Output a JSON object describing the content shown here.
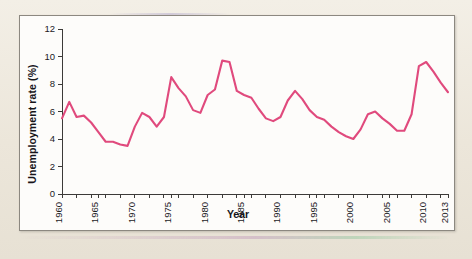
{
  "figure": {
    "panel_background": "#fdfcfa",
    "page_background": "#efeae0",
    "border_color": "#8c8880"
  },
  "axes": {
    "y_title": "Unemployment rate (%)",
    "x_title": "Year",
    "y_ticks": [
      "0",
      "2",
      "4",
      "6",
      "8",
      "10",
      "12"
    ],
    "x_ticks": [
      "1960",
      "1965",
      "1970",
      "1975",
      "1980",
      "1985",
      "1990",
      "1995",
      "2000",
      "2005",
      "2010",
      "2013"
    ]
  },
  "chart_data": {
    "type": "line",
    "title": "",
    "xlabel": "Year",
    "ylabel": "Unemployment rate (%)",
    "xlim": [
      1960,
      2013
    ],
    "ylim": [
      0,
      12
    ],
    "ytick_values": [
      0,
      2,
      4,
      6,
      8,
      10,
      12
    ],
    "xtick_values": [
      1960,
      1965,
      1970,
      1975,
      1980,
      1985,
      1990,
      1995,
      2000,
      2005,
      2010,
      2013
    ],
    "grid": false,
    "legend": "none",
    "line_color": "#e04a7d",
    "x": [
      1960,
      1961,
      1962,
      1963,
      1964,
      1965,
      1966,
      1967,
      1968,
      1969,
      1970,
      1971,
      1972,
      1973,
      1974,
      1975,
      1976,
      1977,
      1978,
      1979,
      1980,
      1981,
      1982,
      1983,
      1984,
      1985,
      1986,
      1987,
      1988,
      1989,
      1990,
      1991,
      1992,
      1993,
      1994,
      1995,
      1996,
      1997,
      1998,
      1999,
      2000,
      2001,
      2002,
      2003,
      2004,
      2005,
      2006,
      2007,
      2008,
      2009,
      2010,
      2011,
      2012,
      2013
    ],
    "series": [
      {
        "name": "Unemployment rate",
        "values": [
          5.5,
          6.7,
          5.6,
          5.7,
          5.2,
          4.5,
          3.8,
          3.8,
          3.6,
          3.5,
          4.9,
          5.9,
          5.6,
          4.9,
          5.6,
          8.5,
          7.7,
          7.1,
          6.1,
          5.9,
          7.2,
          7.6,
          9.7,
          9.6,
          7.5,
          7.2,
          7.0,
          6.2,
          5.5,
          5.3,
          5.6,
          6.8,
          7.5,
          6.9,
          6.1,
          5.6,
          5.4,
          4.9,
          4.5,
          4.2,
          4.0,
          4.7,
          5.8,
          6.0,
          5.5,
          5.1,
          4.6,
          4.6,
          5.8,
          9.3,
          9.6,
          8.9,
          8.1,
          7.4
        ]
      }
    ]
  }
}
